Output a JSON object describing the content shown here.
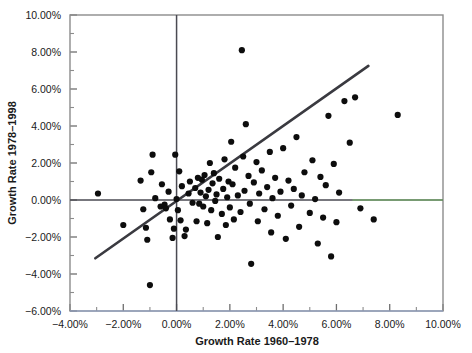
{
  "chart_data": {
    "type": "scatter",
    "title": "",
    "xlabel": "Growth Rate 1960–1978",
    "ylabel": "Growth Rate 1978–1998",
    "xlim": [
      -4.0,
      10.0
    ],
    "ylim": [
      -6.0,
      10.0
    ],
    "xticks": [
      -4.0,
      -2.0,
      0.0,
      2.0,
      4.0,
      6.0,
      8.0,
      10.0
    ],
    "yticks": [
      -6.0,
      -4.0,
      -2.0,
      0.0,
      2.0,
      4.0,
      6.0,
      8.0,
      10.0
    ],
    "xtick_labels": [
      "−4.00%",
      "−2.00%",
      "0.00%",
      "2.00%",
      "4.00%",
      "6.00%",
      "8.00%",
      "10.00%"
    ],
    "ytick_labels": [
      "−6.00%",
      "−4.00%",
      "−2.00%",
      "0.00%",
      "2.00%",
      "4.00%",
      "6.00%",
      "8.00%",
      "10.00%"
    ],
    "tick_format": "percent",
    "minor_ticks": true,
    "grid": false,
    "legend": null,
    "zero_lines": {
      "x": 0.0,
      "y": 0.0
    },
    "trend_line": {
      "type": "linear-fit",
      "x_start": -3.05,
      "y_start": -3.15,
      "x_end": 7.2,
      "y_end": 7.25,
      "slope": 1.015,
      "intercept": -0.06
    },
    "point_count": 108,
    "points": [
      [
        -2.95,
        0.35
      ],
      [
        -2.0,
        -1.35
      ],
      [
        -1.35,
        1.05
      ],
      [
        -1.25,
        -0.5
      ],
      [
        -1.15,
        -1.5
      ],
      [
        -1.1,
        -2.15
      ],
      [
        -1.0,
        -4.6
      ],
      [
        -0.95,
        1.5
      ],
      [
        -0.9,
        2.45
      ],
      [
        -0.8,
        0.1
      ],
      [
        -0.6,
        -0.35
      ],
      [
        -0.55,
        0.85
      ],
      [
        -0.45,
        -0.25
      ],
      [
        -0.4,
        -0.45
      ],
      [
        -0.3,
        0.45
      ],
      [
        -0.25,
        -1.05
      ],
      [
        -0.15,
        -2.05
      ],
      [
        -0.1,
        -1.55
      ],
      [
        -0.05,
        2.45
      ],
      [
        0.0,
        0.05
      ],
      [
        0.05,
        -0.55
      ],
      [
        0.1,
        1.55
      ],
      [
        0.15,
        -1.1
      ],
      [
        0.2,
        0.75
      ],
      [
        0.3,
        -1.95
      ],
      [
        0.35,
        -1.6
      ],
      [
        0.45,
        0.35
      ],
      [
        0.5,
        1.0
      ],
      [
        0.6,
        -0.15
      ],
      [
        0.7,
        0.65
      ],
      [
        0.75,
        -1.15
      ],
      [
        0.8,
        1.2
      ],
      [
        0.85,
        -0.2
      ],
      [
        0.9,
        0.4
      ],
      [
        0.95,
        1.1
      ],
      [
        1.0,
        -0.35
      ],
      [
        1.05,
        1.35
      ],
      [
        1.1,
        0.2
      ],
      [
        1.15,
        -1.25
      ],
      [
        1.2,
        0.55
      ],
      [
        1.25,
        2.0
      ],
      [
        1.3,
        -0.55
      ],
      [
        1.35,
        0.9
      ],
      [
        1.4,
        1.45
      ],
      [
        1.45,
        -0.05
      ],
      [
        1.5,
        0.3
      ],
      [
        1.55,
        -2.0
      ],
      [
        1.6,
        1.15
      ],
      [
        1.7,
        -0.75
      ],
      [
        1.75,
        0.6
      ],
      [
        1.8,
        2.2
      ],
      [
        1.85,
        -1.35
      ],
      [
        1.9,
        0.15
      ],
      [
        1.95,
        1.0
      ],
      [
        2.0,
        -0.4
      ],
      [
        2.05,
        3.15
      ],
      [
        2.1,
        0.85
      ],
      [
        2.15,
        -1.05
      ],
      [
        2.2,
        1.75
      ],
      [
        2.3,
        0.25
      ],
      [
        2.4,
        -0.65
      ],
      [
        2.45,
        8.1
      ],
      [
        2.5,
        2.35
      ],
      [
        2.55,
        0.5
      ],
      [
        2.6,
        4.1
      ],
      [
        2.7,
        1.3
      ],
      [
        2.75,
        -0.2
      ],
      [
        2.8,
        -3.45
      ],
      [
        2.9,
        0.95
      ],
      [
        3.0,
        2.05
      ],
      [
        3.05,
        -1.15
      ],
      [
        3.1,
        0.35
      ],
      [
        3.2,
        1.6
      ],
      [
        3.3,
        -0.5
      ],
      [
        3.4,
        0.7
      ],
      [
        3.5,
        2.6
      ],
      [
        3.55,
        -1.75
      ],
      [
        3.6,
        0.1
      ],
      [
        3.7,
        1.2
      ],
      [
        3.8,
        -0.85
      ],
      [
        3.9,
        0.45
      ],
      [
        4.0,
        2.8
      ],
      [
        4.1,
        -2.1
      ],
      [
        4.2,
        1.05
      ],
      [
        4.3,
        -0.3
      ],
      [
        4.4,
        0.6
      ],
      [
        4.5,
        3.4
      ],
      [
        4.6,
        -1.45
      ],
      [
        4.7,
        0.25
      ],
      [
        4.8,
        1.5
      ],
      [
        5.0,
        -0.7
      ],
      [
        5.1,
        2.15
      ],
      [
        5.2,
        0.05
      ],
      [
        5.3,
        -2.35
      ],
      [
        5.4,
        1.25
      ],
      [
        5.5,
        -0.95
      ],
      [
        5.6,
        0.8
      ],
      [
        5.7,
        4.55
      ],
      [
        5.8,
        -3.05
      ],
      [
        5.9,
        1.95
      ],
      [
        6.0,
        -1.2
      ],
      [
        6.1,
        0.4
      ],
      [
        6.3,
        5.35
      ],
      [
        6.5,
        3.1
      ],
      [
        6.7,
        5.55
      ],
      [
        6.9,
        -0.45
      ],
      [
        7.4,
        -1.05
      ],
      [
        8.3,
        4.6
      ]
    ]
  },
  "style": {
    "point_color": "#0d0d0d",
    "trend_line_color": "#3a3a40",
    "axis_color": "#8c8c8c",
    "zero_line_color": "#4a4a52",
    "background": "#ffffff"
  }
}
